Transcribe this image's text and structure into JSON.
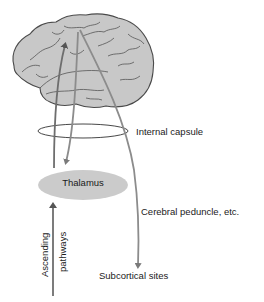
{
  "diagram": {
    "structures": {
      "brain": {
        "name": "Cerebral cortex",
        "fill": "#c8c8c8",
        "stroke": "#555555"
      },
      "internal_capsule": {
        "label": "Internal capsule"
      },
      "thalamus": {
        "label": "Thalamus",
        "fill": "#c9c9c9"
      }
    },
    "labels": {
      "internal_capsule": "Internal capsule",
      "thalamus": "Thalamus",
      "cerebral_peduncle": "Cerebral peduncle, etc.",
      "subcortical_sites": "Subcortical sites",
      "ascending_line1": "Ascending",
      "ascending_line2": "pathways"
    },
    "pathways": [
      {
        "name": "ascending-pathways",
        "from": "below",
        "to": "Thalamus",
        "direction": "up"
      },
      {
        "name": "thalamocortical",
        "from": "Thalamus",
        "to": "Cortex",
        "direction": "up"
      },
      {
        "name": "corticothalamic",
        "from": "Cortex",
        "to": "Thalamus",
        "direction": "down"
      },
      {
        "name": "corticofugal",
        "from": "Cortex",
        "to": "Subcortical sites",
        "via": "Cerebral peduncle, etc.",
        "direction": "down"
      }
    ],
    "colors": {
      "arrow": "#8c8c8c",
      "arrow_dark": "#6e6e6e",
      "outline": "#444444",
      "text": "#1a1a1a"
    }
  }
}
